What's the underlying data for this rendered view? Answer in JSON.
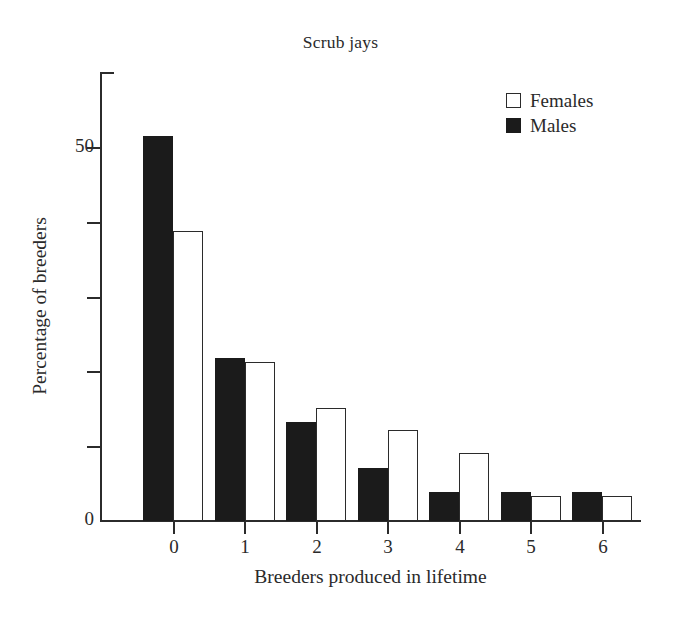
{
  "chart_data": {
    "type": "bar",
    "title": "Scrub jays",
    "xlabel": "Breeders produced in lifetime",
    "ylabel": "Percentage of breeders",
    "categories": [
      "0",
      "1",
      "2",
      "3",
      "4",
      "5",
      "6"
    ],
    "series": [
      {
        "name": "Males",
        "color": "#1b1b1b",
        "fill": "solid",
        "values": [
          51.5,
          21.8,
          13.2,
          7.1,
          3.9,
          3.9,
          3.9
        ]
      },
      {
        "name": "Females",
        "color": "#ffffff",
        "fill": "outline",
        "values": [
          38.8,
          21.3,
          15.1,
          12.2,
          9.1,
          3.3,
          3.3
        ]
      }
    ],
    "ylim": [
      0,
      60
    ],
    "ytick_values": [
      0,
      10,
      20,
      30,
      40,
      50,
      60
    ],
    "ytick_labels": [
      "0",
      "",
      "",
      "",
      "",
      "50",
      ""
    ],
    "grid": false,
    "legend_position": "top-right",
    "legend_entries": [
      "Females",
      "Males"
    ]
  },
  "axes": {
    "y_labels_shown": [
      "50",
      "0"
    ],
    "x_labels": [
      "0",
      "1",
      "2",
      "3",
      "4",
      "5",
      "6"
    ]
  },
  "legend": {
    "females_label": "Females",
    "males_label": "Males"
  }
}
